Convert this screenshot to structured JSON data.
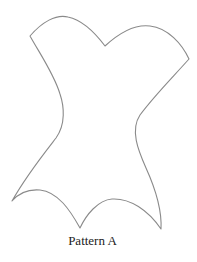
{
  "figure": {
    "caption": "Pattern A",
    "shape": "corset-pattern-outline",
    "stroke_color": "#8a8a8a",
    "background": "#ffffff"
  }
}
